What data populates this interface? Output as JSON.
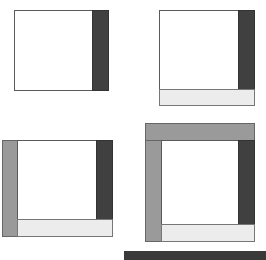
{
  "diagram": {
    "colors": {
      "content": "#ffffff",
      "right_panel": "#404040",
      "bottom_panel": "#ececec",
      "left_panel": "#9a9a9a",
      "top_panel": "#9a9a9a",
      "border": "#5a5a5a"
    },
    "panels": [
      {
        "name": "step-1",
        "regions": [
          "content",
          "right"
        ]
      },
      {
        "name": "step-2",
        "regions": [
          "content",
          "right",
          "bottom"
        ]
      },
      {
        "name": "step-3",
        "regions": [
          "left",
          "content",
          "right",
          "bottom"
        ]
      },
      {
        "name": "step-4",
        "regions": [
          "top",
          "left",
          "content",
          "right",
          "bottom"
        ]
      }
    ]
  }
}
